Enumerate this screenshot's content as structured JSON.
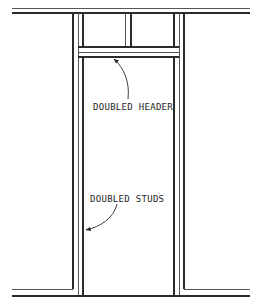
{
  "diagram": {
    "type": "wall-framing-door-opening",
    "colors": {
      "line": "#2a2a2a",
      "background": "#ffffff",
      "text": "#1e1e1e"
    },
    "labels": {
      "header": "DOUBLED HEADER",
      "studs": "DOUBLED STUDS"
    },
    "components": [
      "top plate",
      "doubled header",
      "cripple stud",
      "doubled studs (left)",
      "doubled studs (right)",
      "sole plate"
    ]
  }
}
